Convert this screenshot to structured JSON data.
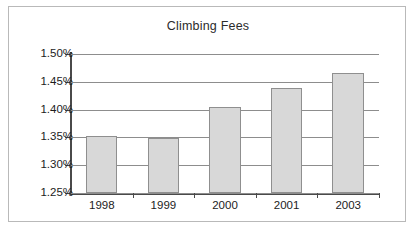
{
  "chart_data": {
    "type": "bar",
    "title": "Climbing Fees",
    "xlabel": "",
    "ylabel": "",
    "categories": [
      "1998",
      "1999",
      "2000",
      "2001",
      "2003"
    ],
    "values": [
      1.353,
      1.349,
      1.404,
      1.438,
      1.466
    ],
    "value_labels": [
      "1.353%",
      "1.349%",
      "1.404%",
      "1.438%",
      "1.466%"
    ],
    "ylim": [
      1.25,
      1.5
    ],
    "ytick_values": [
      1.5,
      1.45,
      1.4,
      1.35,
      1.3,
      1.25
    ],
    "ytick_labels": [
      "1.50%",
      "1.45%",
      "1.40%",
      "1.35%",
      "1.30%",
      "1.25%"
    ],
    "grid": true,
    "legend": false,
    "legend_position": "none",
    "series_name": "Climbing Fees",
    "bar_fill_color": "#d8d8d8",
    "bar_border_color": "#8f8f8f",
    "axis_color": "#4a4a4a",
    "gridline_color": "#8d8d8d",
    "frame_border_color": "#b9b9b9",
    "text_color": "#1c1c1c"
  }
}
